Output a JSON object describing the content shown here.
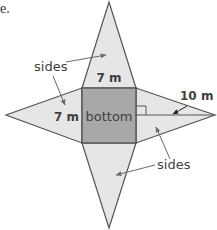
{
  "partial_text": "e.",
  "figure": {
    "type": "square pyramid net",
    "labels": {
      "sides_top_left": "sides",
      "sides_bottom_right": "sides",
      "bottom": "bottom",
      "top_edge": "7 m",
      "left_edge": "7 m",
      "slant_height": "10 m"
    },
    "colors": {
      "face_fill": "#e6e6e6",
      "base_fill": "#a8a8a8",
      "stroke": "#555555",
      "label_text": "#404040",
      "arrow": "#6a6a6a"
    }
  }
}
